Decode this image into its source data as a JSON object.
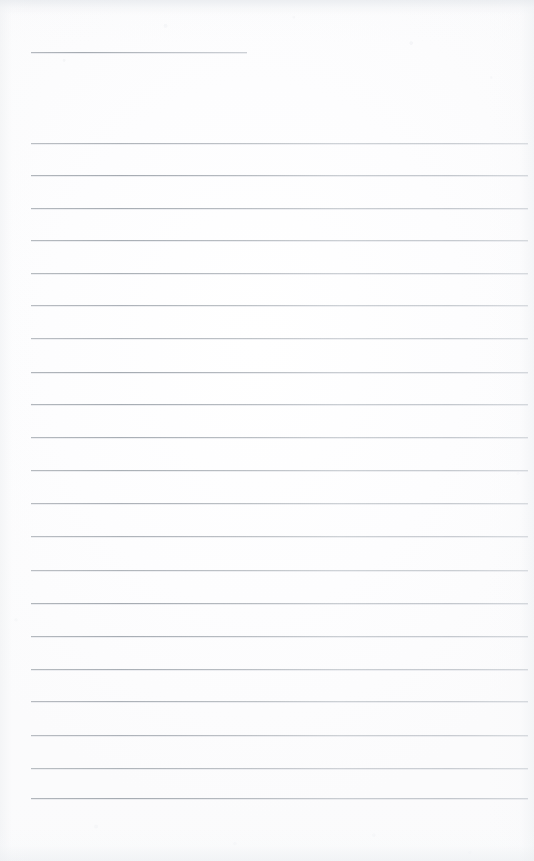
{
  "document": {
    "kind": "scanned-lined-notepad-page",
    "title": "",
    "body_text": "",
    "is_blank": true,
    "page_width_px": 534,
    "page_height_px": 861
  },
  "paper": {
    "background_color": "#fdfdfd",
    "base_white": "#ffffff",
    "edge_shadow_color": "#eef0f2",
    "grain_color": "#e4e7eb"
  },
  "rules": {
    "line_color": "#abb0b6",
    "line_color_faded": "#c4c9cf",
    "ghost_color": "#d6dadf",
    "thickness_px": 1,
    "left_x_px": 31,
    "right_x_px": 528,
    "spacing_px": 32.6,
    "count_full_width": 21,
    "header_rule": {
      "label": "title-rule",
      "y_px": 52,
      "left_x_px": 31,
      "right_x_px": 247,
      "width_px": 216
    },
    "y_positions": [
      143,
      175,
      208,
      240,
      273,
      305,
      338,
      372,
      404,
      437,
      470,
      503,
      536,
      570,
      603,
      636,
      669,
      701,
      735,
      768,
      798
    ]
  },
  "artifacts": {
    "top_band": {
      "y_px": 0,
      "height_px": 16
    },
    "bottom_band": {
      "y_px": 827,
      "height_px": 34
    }
  }
}
